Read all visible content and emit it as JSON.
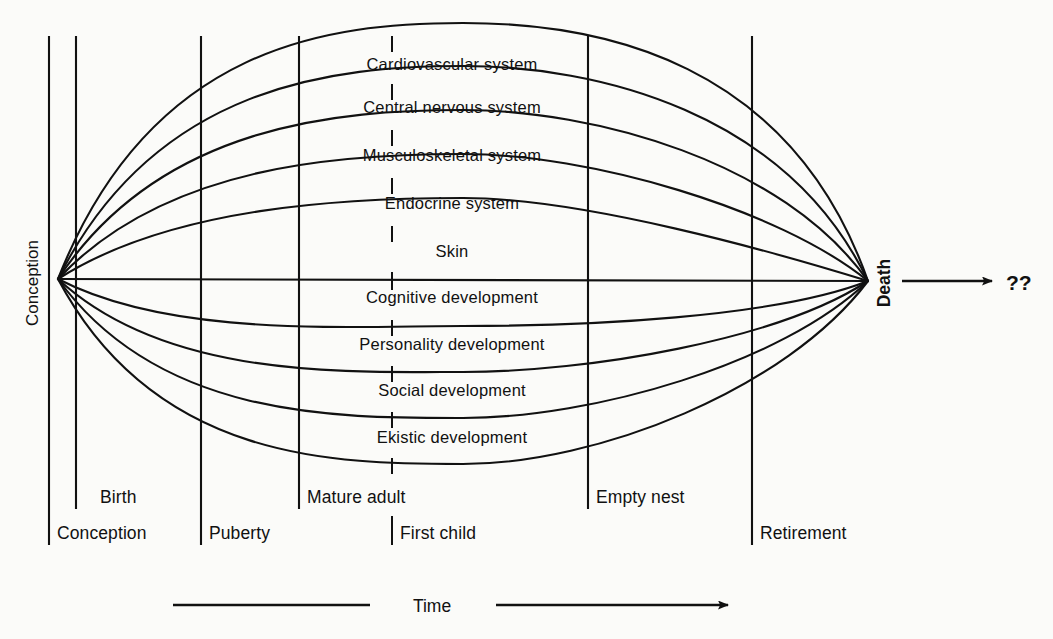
{
  "figure": {
    "background_color": "#fbfbf9",
    "ink_color": "#111111"
  },
  "axis": {
    "left_label": "Conception",
    "right_label": "Death",
    "beyond_death_label": "??",
    "time_label": "Time"
  },
  "curves": [
    {
      "id": "cardiovascular",
      "label": "Cardiovascular system",
      "label_x": 452,
      "label_y": 70
    },
    {
      "id": "central-nervous",
      "label": "Central nervous system",
      "label_x": 452,
      "label_y": 113
    },
    {
      "id": "musculoskeletal",
      "label": "Musculoskeletal system",
      "label_x": 452,
      "label_y": 161
    },
    {
      "id": "endocrine",
      "label": "Endocrine system",
      "label_x": 452,
      "label_y": 209
    },
    {
      "id": "skin",
      "label": "Skin",
      "label_x": 452,
      "label_y": 257
    },
    {
      "id": "cognitive",
      "label": "Cognitive development",
      "label_x": 452,
      "label_y": 303
    },
    {
      "id": "personality",
      "label": "Personality development",
      "label_x": 452,
      "label_y": 350
    },
    {
      "id": "social",
      "label": "Social development",
      "label_x": 452,
      "label_y": 396
    },
    {
      "id": "ekistic",
      "label": "Ekistic development",
      "label_x": 452,
      "label_y": 443
    }
  ],
  "stages": [
    {
      "id": "conception",
      "label": "Conception",
      "x": 49,
      "label_x": 57,
      "label_y": 539,
      "row": "lower"
    },
    {
      "id": "birth",
      "label": "Birth",
      "x": 76,
      "label_x": 100,
      "label_y": 503,
      "row": "upper"
    },
    {
      "id": "puberty",
      "label": "Puberty",
      "x": 201,
      "label_x": 209,
      "label_y": 539,
      "row": "lower"
    },
    {
      "id": "mature-adult",
      "label": "Mature adult",
      "x": 299,
      "label_x": 307,
      "label_y": 503,
      "row": "upper"
    },
    {
      "id": "first-child",
      "label": "First child",
      "x": 392,
      "label_x": 400,
      "label_y": 539,
      "row": "lower"
    },
    {
      "id": "empty-nest",
      "label": "Empty nest",
      "x": 588,
      "label_x": 596,
      "label_y": 503,
      "row": "upper"
    },
    {
      "id": "retirement",
      "label": "Retirement",
      "x": 752,
      "label_x": 760,
      "label_y": 539,
      "row": "lower"
    }
  ],
  "geometry": {
    "origin_x": 58,
    "origin_y": 279,
    "death_x": 868,
    "death_y": 281,
    "curve_peaks": [
      -198,
      -160,
      -122,
      -83,
      -44,
      24,
      62,
      100,
      139
    ]
  }
}
